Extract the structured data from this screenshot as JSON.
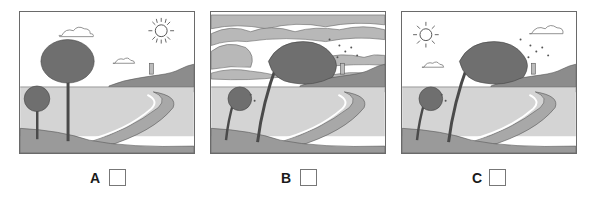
{
  "panels": [
    {
      "id": "A",
      "label": "A",
      "scene": "calm",
      "elements": [
        "sun",
        "two-small-clouds",
        "two-upright-trees",
        "lighthouse-on-hill",
        "curved-beach-shoreline"
      ],
      "checked": false
    },
    {
      "id": "B",
      "label": "B",
      "scene": "stormy",
      "elements": [
        "overcast-sky-many-clouds",
        "two-bent-trees",
        "flying-leaves",
        "lighthouse-on-hill",
        "curved-beach-shoreline"
      ],
      "checked": false
    },
    {
      "id": "C",
      "label": "C",
      "scene": "windy-sunny",
      "elements": [
        "sun",
        "two-small-clouds",
        "two-bent-trees",
        "flying-leaves",
        "lighthouse-on-hill",
        "curved-beach-shoreline"
      ],
      "checked": false
    }
  ],
  "colors": {
    "frame": "#6a6a6a",
    "sky": "#ffffff",
    "sea": "#d4d4d4",
    "hill": "#8c8c8c",
    "ground": "#9a9a9a",
    "foliage": "#6f6f6f",
    "trunk": "#4a4a4a",
    "cloud_storm": "#b8b8b8"
  }
}
